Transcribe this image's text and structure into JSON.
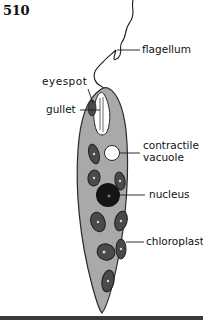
{
  "page": {
    "number": "510"
  },
  "diagram": {
    "labels": {
      "flagellum": "flagellum",
      "eyespot": "eyespot",
      "gullet": "gullet",
      "contractile_vacuole_line1": "contractile",
      "contractile_vacuole_line2": "vacuole",
      "nucleus": "nucleus",
      "chloroplast": "chloroplast"
    },
    "colors": {
      "cell_body": "#a9a9a9",
      "outline": "#2a2a2a",
      "nucleus": "#151515",
      "chloroplast": "#4a4a4a",
      "vacuole": "#ffffff",
      "text": "#111111"
    }
  }
}
